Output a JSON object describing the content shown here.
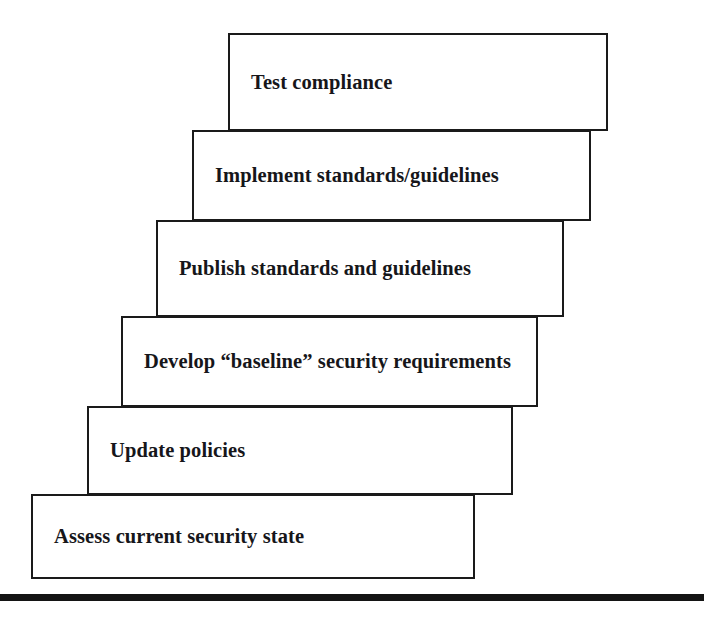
{
  "figure": {
    "type": "stair-step-diagram",
    "orientation": "ascending-left-to-right",
    "background_color": "#ffffff",
    "box_border_color": "#1a1a1a",
    "text_color": "#16161a",
    "rule_color": "#141414"
  },
  "steps": [
    {
      "order": 6,
      "label": "Test compliance"
    },
    {
      "order": 5,
      "label": "Implement standards/guidelines"
    },
    {
      "order": 4,
      "label": "Publish standards and guidelines"
    },
    {
      "order": 3,
      "label": "Develop “baseline” security requirements"
    },
    {
      "order": 2,
      "label": "Update policies"
    },
    {
      "order": 1,
      "label": "Assess current security state"
    }
  ]
}
